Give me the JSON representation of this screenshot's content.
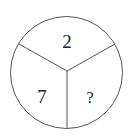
{
  "diagram": {
    "type": "divided-circle-puzzle",
    "sectors": [
      {
        "position": "top",
        "value": "2"
      },
      {
        "position": "bottom-left",
        "value": "7"
      },
      {
        "position": "bottom-right",
        "value": "?"
      }
    ],
    "colors": {
      "stroke": "#555555",
      "text": "#222222",
      "background": "#ffffff"
    }
  }
}
